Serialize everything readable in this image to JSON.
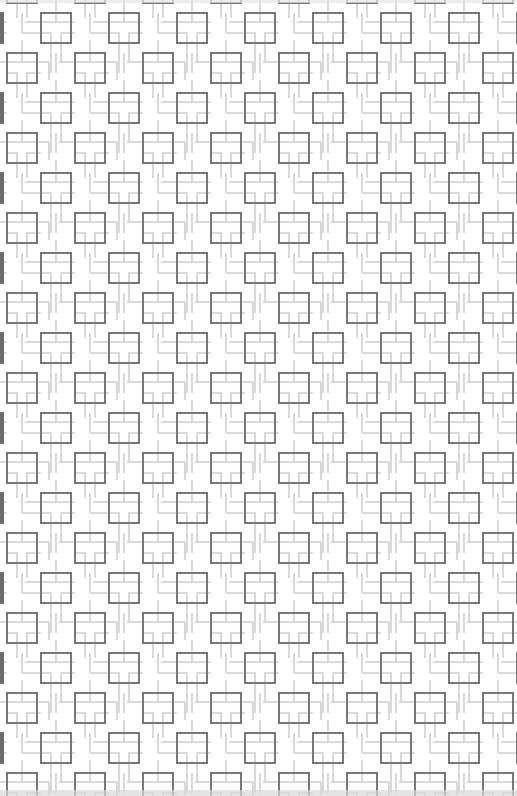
{
  "pattern": {
    "name": "interlocking-squares-meander",
    "tile_width": 68,
    "tile_height": 80,
    "offset_x": 41,
    "offset_y": 13,
    "square_size": 30,
    "colors": {
      "background": "#ffffff",
      "square_stroke": "#777777",
      "line_stroke": "#c8c8c8",
      "edge_bar": "#6b6b6b"
    }
  },
  "canvas": {
    "width": 517,
    "height": 796
  }
}
